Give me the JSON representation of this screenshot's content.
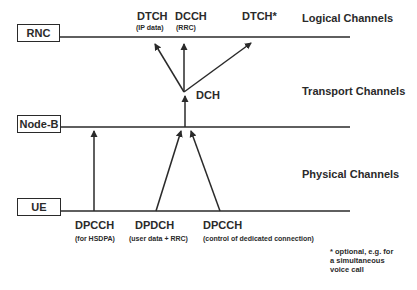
{
  "nodes": {
    "rnc": "RNC",
    "nodeb": "Node-B",
    "ue": "UE"
  },
  "layers": {
    "logical": "Logical Channels",
    "transport": "Transport Channels",
    "physical": "Physical Channels"
  },
  "logical_channels": [
    {
      "name": "DTCH",
      "desc": "(IP data)"
    },
    {
      "name": "DCCH",
      "desc": "(RRC)"
    },
    {
      "name": "DTCH*",
      "desc": ""
    }
  ],
  "transport_channel": {
    "name": "DCH"
  },
  "physical_channels": [
    {
      "name": "DPCCH",
      "desc": "(for HSDPA)"
    },
    {
      "name": "DPDCH",
      "desc": "(user data + RRC)"
    },
    {
      "name": "DPCCH",
      "desc": "(control of dedicated connection)"
    }
  ],
  "footnote": {
    "line1": "* optional, e.g. for",
    "line2": "a simultaneous",
    "line3": "voice call"
  },
  "colors": {
    "stroke": "#2a2a2a",
    "background": "#ffffff"
  }
}
